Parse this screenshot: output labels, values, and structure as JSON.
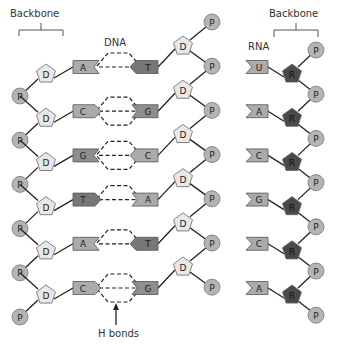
{
  "labels": {
    "backbone_left": "Backbone",
    "backbone_right": "Backbone",
    "dna": "DNA",
    "rna": "RNA",
    "h_bonds": "H bonds"
  },
  "symbols": {
    "phosphate": "P",
    "deoxyribose": "D",
    "ribose": "R"
  },
  "colors": {
    "phosphate": "#b4b4b4",
    "deoxyribose": "#e8e8e8",
    "ribose": "#4a4a4a",
    "base_light": "#ababab",
    "base_mid": "#8e8e8e",
    "base_dark": "#777777",
    "outline": "#555555"
  },
  "dna": {
    "pairs": [
      {
        "left": "A",
        "right": "T",
        "h_bonds": 2
      },
      {
        "left": "C",
        "right": "G",
        "h_bonds": 3
      },
      {
        "left": "G",
        "right": "C",
        "h_bonds": 3
      },
      {
        "left": "T",
        "right": "A",
        "h_bonds": 2
      },
      {
        "left": "A",
        "right": "T",
        "h_bonds": 2
      },
      {
        "left": "C",
        "right": "G",
        "h_bonds": 3
      }
    ]
  },
  "rna": {
    "bases": [
      "U",
      "A",
      "C",
      "G",
      "C",
      "A"
    ]
  }
}
